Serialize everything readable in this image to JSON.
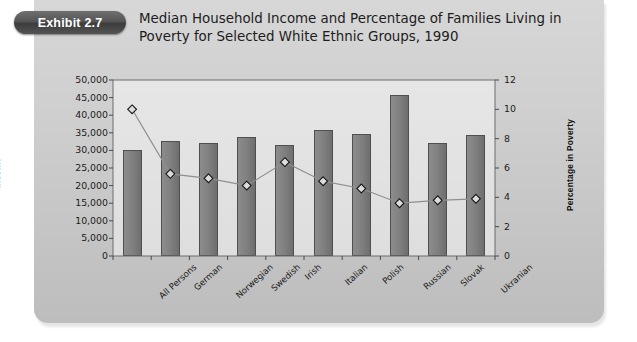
{
  "exhibit": {
    "badge_label": "Exhibit 2.7",
    "title": "Median Household Income and Percentage of Families Living in Poverty for Selected White Ethnic Groups, 1990"
  },
  "colors": {
    "panel": "#cfcfcf",
    "plot_area": "#e2e2e2",
    "bar_fill": "#808080",
    "bar_border": "#4f4f4f",
    "line": "#8a8a8a",
    "marker_fill": "#d8d8d8",
    "marker_border": "#1a1a1a",
    "badge": "#4a4a4a",
    "text": "#1a1a1a"
  },
  "chart_data": {
    "type": "bar",
    "title": "Median Household Income and Percentage of Families Living in Poverty for Selected White Ethnic Groups, 1990",
    "xlabel": "",
    "ylabel": "Income",
    "y2label": "Percentage in Poverty",
    "ylim": [
      0,
      50000
    ],
    "y2lim": [
      0,
      12
    ],
    "grid": false,
    "legend": "none",
    "categories": [
      "All Persons",
      "German",
      "Norwegian",
      "Swedish",
      "Irish",
      "Italian",
      "Polish",
      "Russian",
      "Slovak",
      "Ukranian"
    ],
    "yticks": [
      "0",
      "5,000",
      "10,000",
      "15,000",
      "20,000",
      "25,000",
      "30,000",
      "35,000",
      "40,000",
      "45,000",
      "50,000"
    ],
    "ytick_values": [
      0,
      5000,
      10000,
      15000,
      20000,
      25000,
      30000,
      35000,
      40000,
      45000,
      50000
    ],
    "y2ticks": [
      "0",
      "2",
      "4",
      "6",
      "8",
      "10",
      "12"
    ],
    "y2tick_values": [
      0,
      2,
      4,
      6,
      8,
      10,
      12
    ],
    "series": [
      {
        "name": "Income",
        "type": "bar",
        "axis": "left",
        "values": [
          30000,
          32700,
          32200,
          33800,
          31600,
          35700,
          34800,
          45700,
          32000,
          34400
        ]
      },
      {
        "name": "Percentage in Poverty",
        "type": "line",
        "axis": "right",
        "marker": "diamond",
        "values": [
          10.0,
          5.6,
          5.3,
          4.8,
          6.4,
          5.1,
          4.6,
          3.6,
          3.8,
          3.9
        ]
      }
    ]
  }
}
